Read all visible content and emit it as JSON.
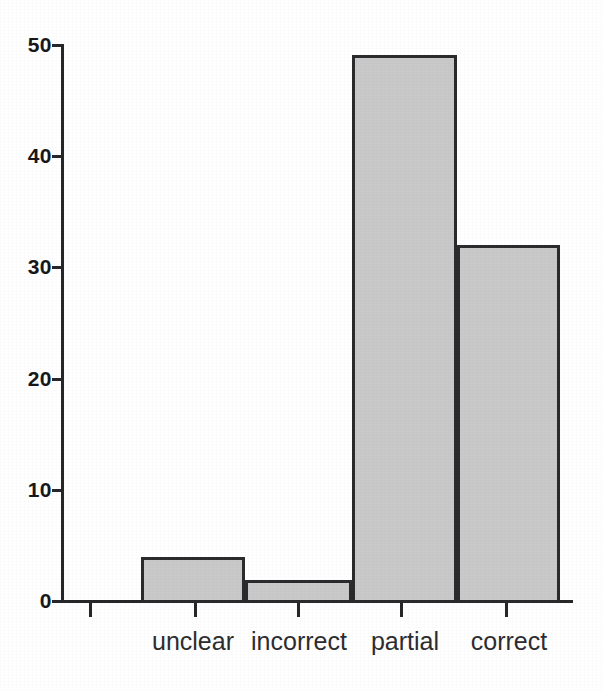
{
  "chart_data": {
    "type": "bar",
    "title": "",
    "subtitle": "",
    "xlabel": "",
    "ylabel": "",
    "categories": [
      "unclear",
      "incorrect",
      "partial",
      "correct"
    ],
    "values": [
      4.0,
      1.9,
      49.1,
      32.0
    ],
    "ylim": [
      0,
      50
    ],
    "yticks": [
      0,
      10,
      20,
      30,
      40,
      50
    ],
    "ytick_labels": [
      "0",
      "10",
      "20",
      "30",
      "40",
      "50"
    ],
    "xtick_labels": [
      "",
      "",
      "",
      "",
      ""
    ],
    "grid": false,
    "legend": null,
    "annotations": [],
    "series": [
      {
        "name": "",
        "values": [
          4.0,
          1.9,
          49.1,
          32.0
        ]
      }
    ]
  },
  "style": {
    "background_color": "#ffffff",
    "bar_fill_color": "#c9c9c9",
    "bar_edge_color": "#2b2b2e",
    "axis_color": "#27272a",
    "tick_label_color": "#18181b",
    "category_label_color": "#2d2d30"
  },
  "geometry": {
    "baseline_y": 601,
    "top_value_y": 45,
    "axis_x": 62,
    "axis_right_x": 573,
    "px_per_unit": 11.12,
    "bars": [
      {
        "category": "unclear",
        "left": 141,
        "right": 245,
        "value": 4.0
      },
      {
        "category": "incorrect",
        "left": 245,
        "right": 352,
        "value": 1.9
      },
      {
        "category": "partial",
        "left": 352,
        "right": 457,
        "value": 49.1
      },
      {
        "category": "correct",
        "left": 457,
        "right": 560,
        "value": 32.0
      }
    ],
    "x_tick_positions": [
      89,
      194,
      297,
      400,
      505
    ],
    "category_label_centers": [
      193,
      299,
      405,
      509
    ]
  }
}
